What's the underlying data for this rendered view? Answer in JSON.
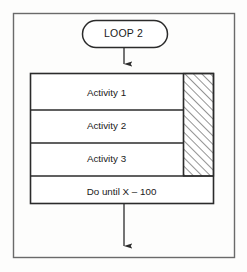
{
  "diagram": {
    "title": "LOOP 2",
    "terminal": {
      "label": "LOOP 2",
      "shape": "stadium"
    },
    "rows": [
      {
        "label": "Activity 1"
      },
      {
        "label": "Activity 2"
      },
      {
        "label": "Activity 3"
      }
    ],
    "footer": {
      "label": "Do until X – 100"
    },
    "hatch_panel": {
      "name": "hatched-region",
      "pattern": "diagonal-lines"
    },
    "connectors": [
      {
        "name": "arrow-into-loop-body",
        "direction": "down"
      },
      {
        "name": "arrow-out-of-loop-body",
        "direction": "down"
      }
    ],
    "colors": {
      "stroke": "#2b2b2b",
      "background": "#fdfdfc",
      "text": "#1a1a1a",
      "hatch": "#3a3a3a"
    }
  }
}
